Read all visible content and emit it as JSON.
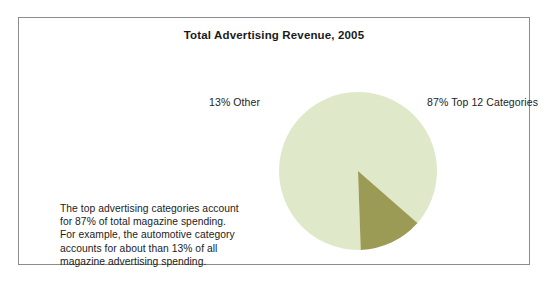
{
  "figure": {
    "title": "Total Advertising Revenue, 2005",
    "caption_lines": [
      "The top advertising categories account",
      "for 87% of total magazine spending.",
      "For example, the automotive category",
      "accounts for about than 13% of all",
      "magazine advertising spending."
    ],
    "labels": {
      "other": "13% Other",
      "top12": "87% Top 12 Categories"
    },
    "colors": {
      "slice_top12": "#dfe8c8",
      "slice_other": "#9b9b55",
      "frame": "#8c8c8c",
      "background": "#ffffff",
      "text": "#1c1c1c",
      "title_text": "#1a1a1a"
    }
  },
  "chart_data": {
    "type": "pie",
    "title": "Total Advertising Revenue, 2005",
    "categories": [
      "Top 12 Categories",
      "Other"
    ],
    "values": [
      87,
      13
    ],
    "value_unit": "percent",
    "labels": [
      "87% Top 12 Categories",
      "13% Other"
    ],
    "colors": [
      "#dfe8c8",
      "#9b9b55"
    ],
    "legend": "none",
    "data_labels_position": "outside",
    "start_angle_deg": 180,
    "direction": "clockwise",
    "grid": false
  }
}
